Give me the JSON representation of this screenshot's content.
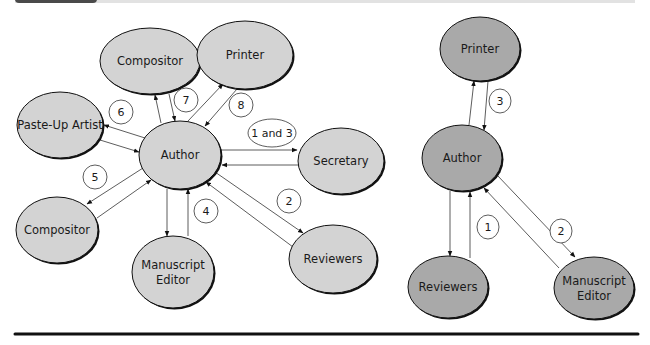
{
  "header": {
    "tab_color": "#4a4a4a",
    "bar_color": "#e2e2e2"
  },
  "colors": {
    "left_node_fill": "#d3d3d3",
    "right_node_fill": "#a9a9a9",
    "node_stroke": "#111111",
    "edge": "#333333",
    "rule": "#111111"
  },
  "left_diagram": {
    "nodes": [
      {
        "id": "author",
        "label": "Author",
        "cx": 180,
        "cy": 155,
        "rx": 41,
        "ry": 34
      },
      {
        "id": "compositor_top",
        "label": "Compositor",
        "cx": 150,
        "cy": 61,
        "rx": 50,
        "ry": 33
      },
      {
        "id": "printer",
        "label": "Printer",
        "cx": 245,
        "cy": 55,
        "rx": 48,
        "ry": 34
      },
      {
        "id": "paste_up_artist",
        "label": "Paste-Up Artist",
        "cx": 60,
        "cy": 125,
        "rx": 43,
        "ry": 33
      },
      {
        "id": "secretary",
        "label": "Secretary",
        "cx": 341,
        "cy": 161,
        "rx": 43,
        "ry": 33
      },
      {
        "id": "compositor_bottom",
        "label": "Compositor",
        "cx": 57,
        "cy": 230,
        "rx": 41,
        "ry": 33
      },
      {
        "id": "manuscript_editor",
        "label_lines": [
          "Manuscript",
          "Editor"
        ],
        "cx": 173,
        "cy": 272,
        "rx": 41,
        "ry": 36
      },
      {
        "id": "reviewers",
        "label": "Reviewers",
        "cx": 333,
        "cy": 259,
        "rx": 44,
        "ry": 34
      }
    ],
    "steps": [
      {
        "label": "1 and 3",
        "cx": 272,
        "cy": 133,
        "rx": 24,
        "ry": 14
      },
      {
        "label": "2",
        "cx": 289,
        "cy": 201,
        "rx": 12,
        "ry": 12
      },
      {
        "label": "4",
        "cx": 206,
        "cy": 211,
        "rx": 12,
        "ry": 12
      },
      {
        "label": "5",
        "cx": 95,
        "cy": 177,
        "rx": 12,
        "ry": 12
      },
      {
        "label": "6",
        "cx": 121,
        "cy": 112,
        "rx": 12,
        "ry": 12
      },
      {
        "label": "7",
        "cx": 186,
        "cy": 100,
        "rx": 12,
        "ry": 12
      },
      {
        "label": "8",
        "cx": 241,
        "cy": 105,
        "rx": 12,
        "ry": 12
      }
    ]
  },
  "right_diagram": {
    "nodes": [
      {
        "id": "printer",
        "label": "Printer",
        "cx": 480,
        "cy": 49,
        "rx": 40,
        "ry": 32
      },
      {
        "id": "author",
        "label": "Author",
        "cx": 462,
        "cy": 158,
        "rx": 40,
        "ry": 33
      },
      {
        "id": "reviewers",
        "label": "Reviewers",
        "cx": 448,
        "cy": 287,
        "rx": 40,
        "ry": 31
      },
      {
        "id": "manuscript_editor",
        "label_lines": [
          "Manuscript",
          "Editor"
        ],
        "cx": 594,
        "cy": 288,
        "rx": 40,
        "ry": 31
      }
    ],
    "steps": [
      {
        "label": "1",
        "cx": 488,
        "cy": 227,
        "rx": 11,
        "ry": 12
      },
      {
        "label": "2",
        "cx": 561,
        "cy": 231,
        "rx": 11,
        "ry": 12
      },
      {
        "label": "3",
        "cx": 500,
        "cy": 101,
        "rx": 11,
        "ry": 12
      }
    ]
  }
}
